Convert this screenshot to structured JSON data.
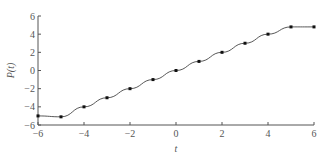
{
  "chart_data": {
    "type": "line",
    "title": "",
    "xlabel": "t",
    "ylabel": "P(t)",
    "x": [
      -6,
      -5,
      -4,
      -3,
      -2,
      -1,
      0,
      1,
      2,
      3,
      4,
      5,
      6
    ],
    "series": [
      {
        "name": "P(t)",
        "values": [
          -5.0,
          -5.1,
          -4.0,
          -3.0,
          -2.0,
          -1.0,
          0.0,
          1.0,
          2.0,
          3.0,
          4.0,
          4.8,
          4.8
        ]
      }
    ],
    "xlim": [
      -6,
      6
    ],
    "ylim": [
      -6,
      6
    ],
    "xticks": [
      "-6",
      "-4",
      "-2",
      "0",
      "2",
      "4",
      "6"
    ],
    "yticks": [
      "6",
      "4",
      "2",
      "0",
      "-2",
      "-4",
      "-6"
    ],
    "grid": false,
    "legend": "none",
    "colors": {
      "line": "#444444",
      "marker": "#111111",
      "axis": "#555555"
    }
  }
}
